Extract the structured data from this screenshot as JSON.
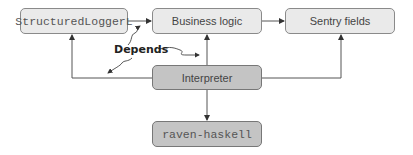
{
  "diagram": {
    "nodes": [
      {
        "id": "structured-logger",
        "label": "StructuredLoggerL",
        "style": "light",
        "font": "mono"
      },
      {
        "id": "business-logic",
        "label": "Business logic",
        "style": "light",
        "font": "sans"
      },
      {
        "id": "sentry-fields",
        "label": "Sentry fields",
        "style": "light",
        "font": "sans"
      },
      {
        "id": "interpreter",
        "label": "Interpreter",
        "style": "dark",
        "font": "sans"
      },
      {
        "id": "raven-haskell",
        "label": "raven-haskell",
        "style": "dark",
        "font": "mono"
      }
    ],
    "edges": [
      {
        "from": "structured-logger",
        "to": "business-logic"
      },
      {
        "from": "business-logic",
        "to": "sentry-fields"
      },
      {
        "from": "interpreter",
        "to": "business-logic"
      },
      {
        "from": "interpreter",
        "to": "structured-logger"
      },
      {
        "from": "interpreter",
        "to": "sentry-fields"
      },
      {
        "from": "interpreter",
        "to": "raven-haskell"
      }
    ],
    "annotation": {
      "label": "Depends"
    },
    "colors": {
      "light_fill": "#eaeaea",
      "dark_fill": "#c4c4c4",
      "border": "#8a8a8a",
      "line": "#555555"
    }
  }
}
